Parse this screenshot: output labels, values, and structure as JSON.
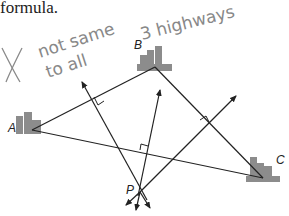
{
  "heading_fragment": "formula.",
  "handwritten_note": {
    "mark": "X",
    "line1": "not same dist",
    "line2": "to all 3 highways"
  },
  "points": {
    "A": {
      "label": "A",
      "x": 35,
      "y": 129
    },
    "B": {
      "label": "B",
      "x": 155,
      "y": 67
    },
    "C": {
      "label": "C",
      "x": 262,
      "y": 177
    },
    "P": {
      "label": "P",
      "x": 140,
      "y": 192
    }
  },
  "colors": {
    "ink": "#222222",
    "pencil": "#8a8a8a",
    "building": "#8c8c8c"
  }
}
